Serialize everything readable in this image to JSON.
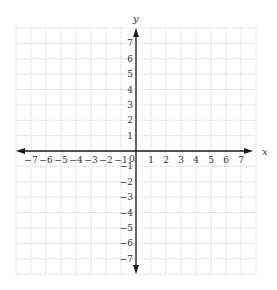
{
  "chart_data": {
    "type": "scatter",
    "title": "",
    "xlabel": "x",
    "ylabel": "y",
    "xlim": [
      -8,
      8
    ],
    "ylim": [
      -8,
      8
    ],
    "grid": true,
    "grid_style": "dotted",
    "x_ticks": [
      -7,
      -6,
      -5,
      -4,
      -3,
      -2,
      -1,
      1,
      2,
      3,
      4,
      5,
      6,
      7
    ],
    "y_ticks": [
      -7,
      -6,
      -5,
      -4,
      -3,
      -2,
      -1,
      1,
      2,
      3,
      4,
      5,
      6,
      7
    ],
    "origin_label": "0",
    "series": [],
    "legend": null
  },
  "colors": {
    "axis": "#1a1a1a",
    "grid": "#c8c8c8",
    "text": "#333333"
  }
}
